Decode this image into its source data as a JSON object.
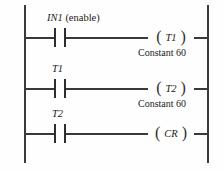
{
  "diagram": {
    "type": "ladder-logic",
    "background_color": "#fefefe",
    "line_color": "#3a3a3a",
    "text_color": "#1a1a1a",
    "rungs": [
      {
        "id": "rung-1",
        "contact": {
          "type": "normally-open",
          "label_italic": "IN1",
          "label_plain": " (enable)"
        },
        "coil": {
          "open_paren": "(",
          "name": "T1",
          "close_paren": ")"
        },
        "annotation": "Constant 60"
      },
      {
        "id": "rung-2",
        "contact": {
          "type": "normally-open",
          "label_italic": "T1",
          "label_plain": ""
        },
        "coil": {
          "open_paren": "(",
          "name": "T2",
          "close_paren": ")"
        },
        "annotation": "Constant 60"
      },
      {
        "id": "rung-3",
        "contact": {
          "type": "normally-open",
          "label_italic": "T2",
          "label_plain": ""
        },
        "coil": {
          "open_paren": "(",
          "name": "CR",
          "close_paren": ")"
        },
        "annotation": ""
      }
    ]
  }
}
